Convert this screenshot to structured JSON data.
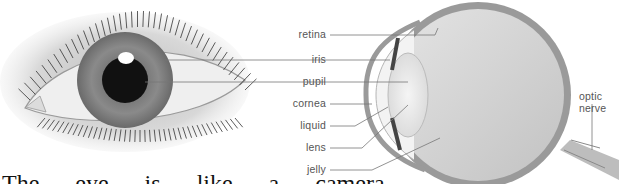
{
  "diagram": {
    "left_figure": "front view of human eye",
    "right_figure": "cross-section of human eye",
    "labels": {
      "retina": "retina",
      "iris": "iris",
      "pupil": "pupil",
      "cornea": "cornea",
      "liquid": "liquid",
      "lens": "lens",
      "jelly": "jelly",
      "optic_nerve_1": "optic",
      "optic_nerve_2": "nerve"
    },
    "caption_fragment": "The eye is like a camera"
  }
}
